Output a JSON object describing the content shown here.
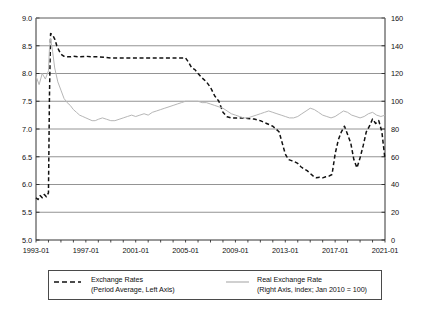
{
  "chart_data": {
    "type": "line",
    "title": "",
    "subtitle": "",
    "xlabel": "",
    "ylabel": "",
    "grid": true,
    "legend_position": "bottom",
    "x_axis": {
      "tick_labels": [
        "1993-01",
        "1997-01",
        "2001-01",
        "2005-01",
        "2009-01",
        "2013-01",
        "2017-01",
        "2021-01"
      ],
      "tick_values": [
        1993.0,
        1997.0,
        2001.0,
        2005.0,
        2009.0,
        2013.0,
        2017.0,
        2021.0
      ],
      "xlim": [
        1993.0,
        2021.0
      ],
      "minor_ticks_per_interval": 4
    },
    "y_axis_left": {
      "tick_labels": [
        "5.0",
        "5.5",
        "6.0",
        "6.5",
        "7.0",
        "7.5",
        "8.0",
        "8.5",
        "9.0"
      ],
      "tick_values": [
        5.0,
        5.5,
        6.0,
        6.5,
        7.0,
        7.5,
        8.0,
        8.5,
        9.0
      ],
      "ylim": [
        5.0,
        9.0
      ],
      "label": "Exchange Rates (Period Average)"
    },
    "y_axis_right": {
      "tick_labels": [
        "0",
        "20",
        "40",
        "60",
        "80",
        "100",
        "120",
        "140",
        "160"
      ],
      "tick_values": [
        0,
        20,
        40,
        60,
        80,
        100,
        120,
        140,
        160
      ],
      "ylim": [
        0,
        160
      ],
      "label": "Real Exchange Rate index, Jan 2010 = 100"
    },
    "series": [
      {
        "name": "Exchange Rates",
        "axis": "left",
        "style": "dashed",
        "color": "#111111",
        "x": [
          1993.0,
          1993.17,
          1993.33,
          1993.5,
          1993.67,
          1993.83,
          1994.0,
          1994.08,
          1994.17,
          1994.33,
          1994.5,
          1994.67,
          1994.83,
          1995.0,
          1995.25,
          1995.5,
          1995.75,
          1996.0,
          1996.5,
          1997.0,
          1997.5,
          1998.0,
          1998.5,
          1999.0,
          1999.5,
          2000.0,
          2000.5,
          2001.0,
          2001.5,
          2002.0,
          2002.5,
          2003.0,
          2003.5,
          2004.0,
          2004.5,
          2005.0,
          2005.25,
          2005.5,
          2005.75,
          2006.0,
          2006.33,
          2006.67,
          2007.0,
          2007.33,
          2007.67,
          2008.0,
          2008.33,
          2008.67,
          2009.0,
          2009.5,
          2010.0,
          2010.5,
          2011.0,
          2011.5,
          2012.0,
          2012.5,
          2013.0,
          2013.25,
          2013.5,
          2013.75,
          2014.0,
          2014.25,
          2014.5,
          2014.75,
          2015.0,
          2015.25,
          2015.5,
          2015.75,
          2016.0,
          2016.25,
          2016.5,
          2016.75,
          2017.0,
          2017.25,
          2017.5,
          2017.75,
          2018.0,
          2018.25,
          2018.5,
          2018.75,
          2019.0,
          2019.25,
          2019.5,
          2019.75,
          2020.0,
          2020.25,
          2020.5,
          2020.75,
          2021.0
        ],
        "y": [
          5.76,
          5.73,
          5.8,
          5.76,
          5.82,
          5.78,
          5.85,
          7.6,
          8.72,
          8.7,
          8.62,
          8.5,
          8.42,
          8.35,
          8.31,
          8.3,
          8.3,
          8.31,
          8.3,
          8.31,
          8.3,
          8.3,
          8.29,
          8.28,
          8.28,
          8.28,
          8.28,
          8.28,
          8.28,
          8.28,
          8.28,
          8.28,
          8.28,
          8.28,
          8.28,
          8.28,
          8.2,
          8.1,
          8.07,
          8.0,
          7.92,
          7.85,
          7.75,
          7.6,
          7.5,
          7.3,
          7.22,
          7.2,
          7.2,
          7.2,
          7.19,
          7.18,
          7.15,
          7.1,
          7.05,
          6.95,
          6.55,
          6.45,
          6.43,
          6.41,
          6.38,
          6.32,
          6.28,
          6.25,
          6.2,
          6.15,
          6.12,
          6.13,
          6.12,
          6.14,
          6.15,
          6.18,
          6.55,
          6.8,
          6.95,
          7.05,
          6.9,
          6.75,
          6.45,
          6.3,
          6.48,
          6.7,
          6.95,
          7.05,
          7.18,
          7.1,
          7.15,
          6.95,
          6.45
        ]
      },
      {
        "name": "Real Exchange Rate",
        "axis": "right",
        "style": "solid",
        "color": "#b6b6b6",
        "x": [
          1993.0,
          1993.25,
          1993.5,
          1993.75,
          1994.0,
          1994.08,
          1994.17,
          1994.33,
          1994.5,
          1994.75,
          1995.0,
          1995.25,
          1995.5,
          1995.75,
          1996.0,
          1996.25,
          1996.5,
          1996.75,
          1997.0,
          1997.25,
          1997.5,
          1997.75,
          1998.0,
          1998.33,
          1998.67,
          1999.0,
          1999.33,
          1999.67,
          2000.0,
          2000.33,
          2000.67,
          2001.0,
          2001.33,
          2001.67,
          2002.0,
          2002.33,
          2002.67,
          2003.0,
          2003.33,
          2003.67,
          2004.0,
          2004.33,
          2004.67,
          2005.0,
          2005.33,
          2005.67,
          2006.0,
          2006.33,
          2006.67,
          2007.0,
          2007.33,
          2007.67,
          2008.0,
          2008.33,
          2008.67,
          2009.0,
          2009.33,
          2009.67,
          2010.0,
          2010.33,
          2010.67,
          2011.0,
          2011.33,
          2011.67,
          2012.0,
          2012.33,
          2012.67,
          2013.0,
          2013.33,
          2013.67,
          2014.0,
          2014.33,
          2014.67,
          2015.0,
          2015.33,
          2015.67,
          2016.0,
          2016.33,
          2016.67,
          2017.0,
          2017.33,
          2017.67,
          2018.0,
          2018.33,
          2018.67,
          2019.0,
          2019.33,
          2019.67,
          2020.0,
          2020.33,
          2020.67,
          2021.0
        ],
        "y": [
          118,
          112,
          120,
          116,
          122,
          138,
          145,
          136,
          124,
          114,
          108,
          102,
          99,
          97,
          94,
          92,
          90,
          89,
          88,
          87,
          86,
          86,
          87,
          88,
          87,
          86,
          86,
          87,
          88,
          89,
          90,
          89,
          90,
          91,
          90,
          92,
          93,
          94,
          95,
          96,
          97,
          98,
          99,
          100,
          100,
          100,
          100,
          99,
          99,
          98,
          97,
          96,
          95,
          93,
          91,
          90,
          89,
          88,
          88,
          89,
          90,
          91,
          92,
          93,
          92,
          91,
          90,
          89,
          88,
          88,
          89,
          91,
          93,
          95,
          94,
          92,
          90,
          89,
          88,
          89,
          91,
          93,
          92,
          90,
          89,
          88,
          89,
          91,
          92,
          90,
          89,
          90
        ]
      }
    ]
  },
  "legend": {
    "entries": [
      {
        "label": "Exchange Rates",
        "sub": "(Period Average, Left Axis)",
        "swatch": "dashed-line-swatch"
      },
      {
        "label": "Real Exchange Rate",
        "sub": "(Right Axis, index; Jan 2010 = 100)",
        "swatch": "solid-line-swatch"
      }
    ]
  }
}
